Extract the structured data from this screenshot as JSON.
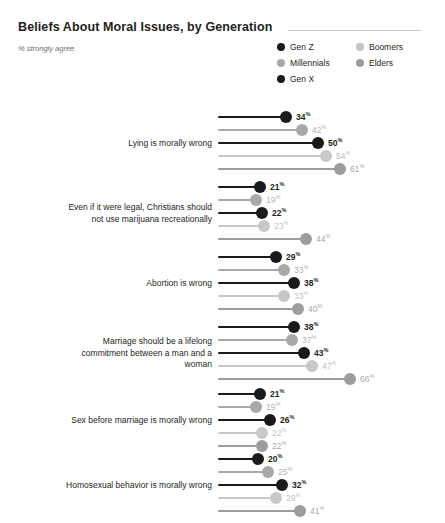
{
  "header": {
    "title": "Beliefs About Moral Issues, by Generation",
    "subtitle": "% strongly agree"
  },
  "legend": {
    "columns": [
      [
        {
          "label": "Gen Z",
          "color": "#1a1a1a"
        },
        {
          "label": "Millennials",
          "color": "#a8a8a8"
        },
        {
          "label": "Gen X",
          "color": "#1a1a1a"
        }
      ],
      [
        {
          "label": "Boomers",
          "color": "#c4c4c4"
        },
        {
          "label": "Elders",
          "color": "#9d9d9d"
        }
      ]
    ]
  },
  "series_order": [
    "Gen Z",
    "Millennials",
    "Gen X",
    "Boomers",
    "Elders"
  ],
  "colors": {
    "gen_z": "#1a1a1a",
    "millennials": "#a8a8a8",
    "gen_x": "#1a1a1a",
    "boomers": "#c8c8c8",
    "elders": "#9d9d9d",
    "value_dark": "#231f20",
    "value_light": "#b3b3b3",
    "value_mid": "#9d9d9d",
    "rule": "#c9c9c9"
  },
  "chart_data": {
    "type": "bar",
    "title": "Beliefs About Moral Issues, by Generation",
    "subtitle": "% strongly agree",
    "xlabel": "",
    "ylabel": "",
    "xlim": [
      0,
      70
    ],
    "grid": false,
    "legend_position": "top-right",
    "units": "%",
    "categories": [
      "Lying is morally wrong",
      "Even if it were legal, Christians should not use marijuana recreationally",
      "Abortion is wrong",
      "Marriage should be a lifelong commitment between a man and a woman",
      "Sex before marriage is morally wrong",
      "Homosexual behavior is morally wrong"
    ],
    "series": [
      {
        "name": "Gen Z",
        "values": [
          34,
          21,
          29,
          38,
          21,
          20
        ]
      },
      {
        "name": "Millennials",
        "values": [
          42,
          19,
          33,
          37,
          19,
          25
        ]
      },
      {
        "name": "Gen X",
        "values": [
          50,
          22,
          38,
          43,
          26,
          32
        ]
      },
      {
        "name": "Boomers",
        "values": [
          54,
          23,
          33,
          47,
          22,
          29
        ]
      },
      {
        "name": "Elders",
        "values": [
          61,
          44,
          40,
          66,
          22,
          41
        ]
      }
    ]
  },
  "groups": [
    {
      "label_lines": [
        "Lying is morally wrong"
      ],
      "rows": [
        {
          "series": "Gen Z",
          "value": 34,
          "suffix": "%",
          "color": "#1a1a1a",
          "text_color": "#231f20",
          "emphasis": "dark"
        },
        {
          "series": "Millennials",
          "value": 42,
          "suffix": "%",
          "color": "#a8a8a8",
          "text_color": "#b3b3b3",
          "emphasis": "light"
        },
        {
          "series": "Gen X",
          "value": 50,
          "suffix": "%",
          "color": "#1a1a1a",
          "text_color": "#231f20",
          "emphasis": "dark"
        },
        {
          "series": "Boomers",
          "value": 54,
          "suffix": "%",
          "color": "#c8c8c8",
          "text_color": "#bfbfbf",
          "emphasis": "light"
        },
        {
          "series": "Elders",
          "value": 61,
          "suffix": "%",
          "color": "#9d9d9d",
          "text_color": "#aaaaaa",
          "emphasis": "light"
        }
      ]
    },
    {
      "label_lines": [
        "Even if it were legal, Christians should",
        "not use marijuana recreationally"
      ],
      "rows": [
        {
          "series": "Gen Z",
          "value": 21,
          "suffix": "%",
          "color": "#1a1a1a",
          "text_color": "#231f20",
          "emphasis": "dark"
        },
        {
          "series": "Millennials",
          "value": 19,
          "suffix": "%",
          "color": "#a8a8a8",
          "text_color": "#b3b3b3",
          "emphasis": "light"
        },
        {
          "series": "Gen X",
          "value": 22,
          "suffix": "%",
          "color": "#1a1a1a",
          "text_color": "#231f20",
          "emphasis": "dark"
        },
        {
          "series": "Boomers",
          "value": 23,
          "suffix": "%",
          "color": "#c8c8c8",
          "text_color": "#c4c4c4",
          "emphasis": "light"
        },
        {
          "series": "Elders",
          "value": 44,
          "suffix": "%",
          "color": "#9d9d9d",
          "text_color": "#aaaaaa",
          "emphasis": "light"
        }
      ]
    },
    {
      "label_lines": [
        "Abortion is wrong"
      ],
      "rows": [
        {
          "series": "Gen Z",
          "value": 29,
          "suffix": "%",
          "color": "#1a1a1a",
          "text_color": "#231f20",
          "emphasis": "dark"
        },
        {
          "series": "Millennials",
          "value": 33,
          "suffix": "%",
          "color": "#a8a8a8",
          "text_color": "#b3b3b3",
          "emphasis": "light"
        },
        {
          "series": "Gen X",
          "value": 38,
          "suffix": "%",
          "color": "#1a1a1a",
          "text_color": "#231f20",
          "emphasis": "dark"
        },
        {
          "series": "Boomers",
          "value": 33,
          "suffix": "%",
          "color": "#c8c8c8",
          "text_color": "#c4c4c4",
          "emphasis": "light"
        },
        {
          "series": "Elders",
          "value": 40,
          "suffix": "%",
          "color": "#9d9d9d",
          "text_color": "#aaaaaa",
          "emphasis": "light"
        }
      ]
    },
    {
      "label_lines": [
        "Marriage should be a lifelong",
        "commitment between a man and a",
        "woman"
      ],
      "rows": [
        {
          "series": "Gen Z",
          "value": 38,
          "suffix": "%",
          "color": "#1a1a1a",
          "text_color": "#231f20",
          "emphasis": "dark"
        },
        {
          "series": "Millennials",
          "value": 37,
          "suffix": "%",
          "color": "#a8a8a8",
          "text_color": "#b3b3b3",
          "emphasis": "light"
        },
        {
          "series": "Gen X",
          "value": 43,
          "suffix": "%",
          "color": "#1a1a1a",
          "text_color": "#231f20",
          "emphasis": "dark"
        },
        {
          "series": "Boomers",
          "value": 47,
          "suffix": "%",
          "color": "#c8c8c8",
          "text_color": "#bfbfbf",
          "emphasis": "light"
        },
        {
          "series": "Elders",
          "value": 66,
          "suffix": "%",
          "color": "#9d9d9d",
          "text_color": "#aaaaaa",
          "emphasis": "light"
        }
      ]
    },
    {
      "label_lines": [
        "Sex before marriage is morally wrong"
      ],
      "rows": [
        {
          "series": "Gen Z",
          "value": 21,
          "suffix": "%",
          "color": "#1a1a1a",
          "text_color": "#231f20",
          "emphasis": "dark"
        },
        {
          "series": "Millennials",
          "value": 19,
          "suffix": "%",
          "color": "#a8a8a8",
          "text_color": "#b3b3b3",
          "emphasis": "light"
        },
        {
          "series": "Gen X",
          "value": 26,
          "suffix": "%",
          "color": "#1a1a1a",
          "text_color": "#231f20",
          "emphasis": "dark"
        },
        {
          "series": "Boomers",
          "value": 22,
          "suffix": "%",
          "color": "#c8c8c8",
          "text_color": "#c4c4c4",
          "emphasis": "light"
        },
        {
          "series": "Elders",
          "value": 22,
          "suffix": "%",
          "color": "#9d9d9d",
          "text_color": "#aaaaaa",
          "emphasis": "light"
        }
      ]
    },
    {
      "label_lines": [
        "Homosexual behavior is morally wrong"
      ],
      "rows": [
        {
          "series": "Gen Z",
          "value": 20,
          "suffix": "%",
          "color": "#1a1a1a",
          "text_color": "#231f20",
          "emphasis": "dark"
        },
        {
          "series": "Millennials",
          "value": 25,
          "suffix": "%",
          "color": "#a8a8a8",
          "text_color": "#b3b3b3",
          "emphasis": "light"
        },
        {
          "series": "Gen X",
          "value": 32,
          "suffix": "%",
          "color": "#1a1a1a",
          "text_color": "#231f20",
          "emphasis": "dark"
        },
        {
          "series": "Boomers",
          "value": 29,
          "suffix": "%",
          "color": "#c8c8c8",
          "text_color": "#c4c4c4",
          "emphasis": "light"
        },
        {
          "series": "Elders",
          "value": 41,
          "suffix": "%",
          "color": "#9d9d9d",
          "text_color": "#aaaaaa",
          "emphasis": "light"
        }
      ]
    }
  ]
}
